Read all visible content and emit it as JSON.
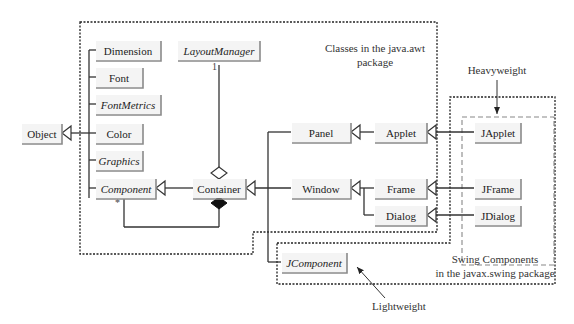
{
  "diagram": {
    "classes": [
      {
        "id": "object",
        "label": "Object",
        "italic": false
      },
      {
        "id": "dimension",
        "label": "Dimension",
        "italic": false
      },
      {
        "id": "font",
        "label": "Font",
        "italic": false
      },
      {
        "id": "fontmetrics",
        "label": "FontMetrics",
        "italic": true
      },
      {
        "id": "color",
        "label": "Color",
        "italic": false
      },
      {
        "id": "graphics",
        "label": "Graphics",
        "italic": true
      },
      {
        "id": "component",
        "label": "Component",
        "italic": true
      },
      {
        "id": "layoutmanager",
        "label": "LayoutManager",
        "italic": true
      },
      {
        "id": "container",
        "label": "Container",
        "italic": false
      },
      {
        "id": "panel",
        "label": "Panel",
        "italic": false
      },
      {
        "id": "window",
        "label": "Window",
        "italic": false
      },
      {
        "id": "applet",
        "label": "Applet",
        "italic": false
      },
      {
        "id": "frame",
        "label": "Frame",
        "italic": false
      },
      {
        "id": "dialog",
        "label": "Dialog",
        "italic": false
      },
      {
        "id": "japplet",
        "label": "JApplet",
        "italic": false
      },
      {
        "id": "jframe",
        "label": "JFrame",
        "italic": false
      },
      {
        "id": "jdialog",
        "label": "JDialog",
        "italic": false
      },
      {
        "id": "jcomponent",
        "label": "JComponent",
        "italic": true
      }
    ],
    "relations": [
      {
        "type": "inheritance",
        "from": "dimension",
        "to": "object"
      },
      {
        "type": "inheritance",
        "from": "font",
        "to": "object"
      },
      {
        "type": "inheritance",
        "from": "fontmetrics",
        "to": "object"
      },
      {
        "type": "inheritance",
        "from": "color",
        "to": "object"
      },
      {
        "type": "inheritance",
        "from": "graphics",
        "to": "object"
      },
      {
        "type": "inheritance",
        "from": "component",
        "to": "object"
      },
      {
        "type": "inheritance",
        "from": "container",
        "to": "component"
      },
      {
        "type": "inheritance",
        "from": "panel",
        "to": "container"
      },
      {
        "type": "inheritance",
        "from": "window",
        "to": "container"
      },
      {
        "type": "inheritance",
        "from": "jcomponent",
        "to": "container"
      },
      {
        "type": "inheritance",
        "from": "applet",
        "to": "panel"
      },
      {
        "type": "inheritance",
        "from": "frame",
        "to": "window"
      },
      {
        "type": "inheritance",
        "from": "dialog",
        "to": "window"
      },
      {
        "type": "inheritance",
        "from": "japplet",
        "to": "applet"
      },
      {
        "type": "inheritance",
        "from": "jframe",
        "to": "frame"
      },
      {
        "type": "inheritance",
        "from": "jdialog",
        "to": "dialog"
      },
      {
        "type": "aggregation",
        "from": "container",
        "to": "layoutmanager",
        "multiplicity": "1"
      },
      {
        "type": "composition",
        "from": "container",
        "to": "component",
        "multiplicity": "*"
      }
    ],
    "multiplicities": {
      "layoutmanager": "1",
      "component": "*"
    },
    "packages": {
      "awt_label_line1": "Classes in the java.awt",
      "awt_label_line2": "package",
      "swing_label_line1": "Swing Components",
      "swing_label_line2": "in the javax.swing package"
    },
    "annotations": {
      "heavyweight": "Heavyweight",
      "lightweight": "Lightweight"
    }
  }
}
